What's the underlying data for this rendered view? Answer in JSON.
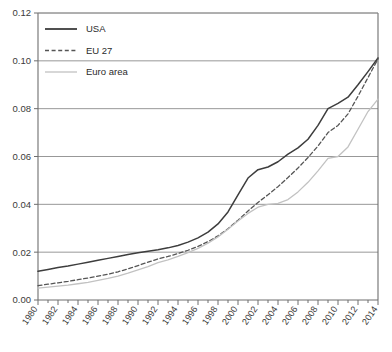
{
  "chart_data": {
    "type": "line",
    "title": "",
    "xlabel": "",
    "ylabel": "",
    "xlim": [
      1980,
      2014
    ],
    "ylim": [
      0.0,
      0.12
    ],
    "grid": true,
    "legend_position": "top-left",
    "ytick_labels": [
      "0.00",
      "0.02",
      "0.04",
      "0.06",
      "0.08",
      "0.10",
      "0.12"
    ],
    "ytick_values": [
      0.0,
      0.02,
      0.04,
      0.06,
      0.08,
      0.1,
      0.12
    ],
    "xtick_labels": [
      "1980",
      "1982",
      "1984",
      "1986",
      "1988",
      "1990",
      "1992",
      "1994",
      "1996",
      "1998",
      "2000",
      "2002",
      "2004",
      "2006",
      "2008",
      "2010",
      "2012",
      "2014"
    ],
    "xtick_values": [
      1980,
      1982,
      1984,
      1986,
      1988,
      1990,
      1992,
      1994,
      1996,
      1998,
      2000,
      2002,
      2004,
      2006,
      2008,
      2010,
      2012,
      2014
    ],
    "x": [
      1980,
      1981,
      1982,
      1983,
      1984,
      1985,
      1986,
      1987,
      1988,
      1989,
      1990,
      1991,
      1992,
      1993,
      1994,
      1995,
      1996,
      1997,
      1998,
      1999,
      2000,
      2001,
      2002,
      2003,
      2004,
      2005,
      2006,
      2007,
      2008,
      2009,
      2010,
      2011,
      2012,
      2013,
      2014
    ],
    "series": [
      {
        "name": "USA",
        "color": "#3d3d3d",
        "style": "solid",
        "values": [
          0.012,
          0.0128,
          0.0136,
          0.0142,
          0.015,
          0.0158,
          0.0166,
          0.0174,
          0.0182,
          0.019,
          0.0198,
          0.0204,
          0.021,
          0.0218,
          0.0228,
          0.0242,
          0.026,
          0.0284,
          0.0318,
          0.0368,
          0.044,
          0.051,
          0.0545,
          0.0556,
          0.0578,
          0.061,
          0.0636,
          0.0672,
          0.073,
          0.08,
          0.0822,
          0.0848,
          0.09,
          0.0955,
          0.1012
        ]
      },
      {
        "name": "EU 27",
        "color": "#555555",
        "style": "dashed",
        "values": [
          0.006,
          0.0066,
          0.0072,
          0.0078,
          0.0085,
          0.0092,
          0.01,
          0.0108,
          0.0118,
          0.013,
          0.0144,
          0.0158,
          0.0172,
          0.0182,
          0.0194,
          0.0208,
          0.0224,
          0.0244,
          0.0268,
          0.0298,
          0.0334,
          0.0372,
          0.0408,
          0.044,
          0.0474,
          0.0512,
          0.0552,
          0.0596,
          0.0644,
          0.07,
          0.073,
          0.0778,
          0.0852,
          0.093,
          0.1008
        ]
      },
      {
        "name": "Euro area",
        "color": "#c2c2c2",
        "style": "solid",
        "values": [
          0.005,
          0.0054,
          0.0058,
          0.0062,
          0.0068,
          0.0074,
          0.0082,
          0.009,
          0.01,
          0.0112,
          0.0126,
          0.014,
          0.0156,
          0.0168,
          0.0182,
          0.0198,
          0.0216,
          0.0238,
          0.0264,
          0.0296,
          0.033,
          0.0362,
          0.0388,
          0.04,
          0.0404,
          0.042,
          0.0452,
          0.0492,
          0.054,
          0.0592,
          0.06,
          0.064,
          0.0714,
          0.0788,
          0.084
        ]
      }
    ]
  },
  "legend": {
    "items": [
      {
        "label": "USA"
      },
      {
        "label": "EU 27"
      },
      {
        "label": "Euro area"
      }
    ]
  },
  "axes": {
    "frame_color": "#6e6e6e",
    "grid_color": "#8c8c8c"
  }
}
